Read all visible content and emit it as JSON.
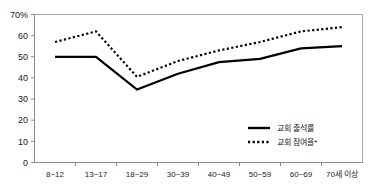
{
  "chart_data": {
    "type": "line",
    "title": "",
    "subtitle": "",
    "xlabel": "",
    "ylabel": "",
    "ylim": [
      0,
      70
    ],
    "yticks": [
      0,
      10,
      20,
      30,
      40,
      50,
      60,
      70
    ],
    "ytick_labels": [
      "0",
      "10",
      "20",
      "30",
      "40",
      "50",
      "60",
      "70%"
    ],
    "grid": false,
    "legend_position": "bottom-right",
    "categories": [
      "8~12",
      "13~17",
      "18~29",
      "30~39",
      "40~49",
      "50~59",
      "60~69",
      "70세 이상"
    ],
    "series": [
      {
        "name": "교회 출석률",
        "style": "solid",
        "color": "#000000",
        "values": [
          50,
          50,
          34.5,
          42,
          47.5,
          49,
          54,
          55
        ]
      },
      {
        "name": "교회 참여율*",
        "style": "dotted",
        "color": "#000000",
        "values": [
          57,
          62,
          40.5,
          48,
          53,
          57,
          62,
          64
        ]
      }
    ]
  },
  "legend": {
    "items": [
      {
        "label": "교회 출석률",
        "style": "solid"
      },
      {
        "label": "교회 참여율*",
        "style": "dotted"
      }
    ]
  },
  "colors": {
    "line": "#000000",
    "axis": "#8a8a8a",
    "frame": "#a8a8a8",
    "text": "#1a1a1a",
    "background": "#ffffff"
  }
}
